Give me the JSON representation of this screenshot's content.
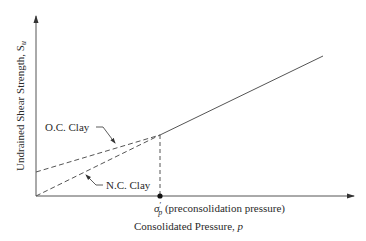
{
  "diagram": {
    "y_axis_label": "Undrained Shear Strength, S",
    "y_axis_label_sub": "u",
    "x_axis_label": "Consolidated Pressure, ",
    "x_axis_label_var": "p",
    "point_label_symbol": "σ",
    "point_label_prime": "′",
    "point_label_sub": "p",
    "point_label_text": " (preconsolidation pressure)",
    "oc_label": "O.C. Clay",
    "nc_label": "N.C. Clay",
    "colors": {
      "line": "#555555",
      "text": "#2a2a2a"
    }
  }
}
